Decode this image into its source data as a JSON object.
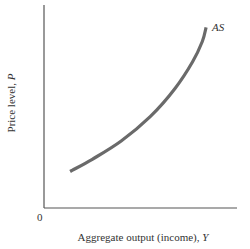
{
  "chart_data": {
    "type": "line",
    "title": "",
    "xlabel": "Aggregate output (income), ",
    "xlabel_var": "Y",
    "ylabel": "Price level, ",
    "ylabel_var": "P",
    "origin_label": "0",
    "xlim": [
      0,
      100
    ],
    "ylim": [
      0,
      100
    ],
    "grid": false,
    "legend": "none",
    "series": [
      {
        "name": "AS",
        "label": "AS",
        "color": "#6a6a6a",
        "points": [
          [
            13.5,
            18
          ],
          [
            25,
            24
          ],
          [
            40,
            33
          ],
          [
            55,
            45
          ],
          [
            68,
            59
          ],
          [
            77,
            72
          ],
          [
            82,
            82
          ],
          [
            84,
            89
          ]
        ]
      }
    ]
  }
}
